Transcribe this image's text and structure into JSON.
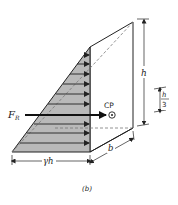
{
  "figure": {
    "caption": "(b)",
    "labels": {
      "resultant_force": "F",
      "resultant_force_sub": "R",
      "center_of_pressure": "CP",
      "height": "h",
      "third_num": "h",
      "third_den": "3",
      "base_pressure": "γh",
      "width": "b"
    },
    "colors": {
      "prism_fill": "#b9b9b9",
      "line": "#222222",
      "dashed": "#777777"
    }
  }
}
